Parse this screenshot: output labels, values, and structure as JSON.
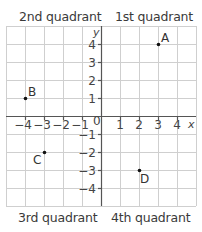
{
  "diagram": {
    "quadrant_labels": {
      "q2": "2nd quadrant",
      "q1": "1st quadrant",
      "q3": "3rd quadrant",
      "q4": "4th quadrant"
    },
    "axes": {
      "x_label": "x",
      "y_label": "y",
      "origin_label": "0",
      "x_ticks": [
        "−4",
        "−3",
        "−2",
        "−1",
        "1",
        "2",
        "3",
        "4"
      ],
      "y_ticks": [
        "4",
        "3",
        "2",
        "1",
        "−1",
        "−2",
        "−3",
        "−4"
      ],
      "range": {
        "x": [
          -5,
          5
        ],
        "y": [
          -5,
          5
        ]
      }
    },
    "points": [
      {
        "label": "A",
        "x": 3,
        "y": 4
      },
      {
        "label": "B",
        "x": -4,
        "y": 1
      },
      {
        "label": "C",
        "x": -3,
        "y": -2
      },
      {
        "label": "D",
        "x": 2,
        "y": -3
      }
    ],
    "colors": {
      "grid": "#cfcfcf",
      "axis": "#555555",
      "point": "#111111"
    }
  }
}
